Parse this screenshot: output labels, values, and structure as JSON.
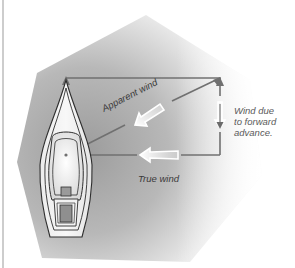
{
  "diagram": {
    "labels": {
      "apparent_wind": "Apparent wind",
      "forward_wind_line1": "Wind due",
      "forward_wind_line2": "to forward",
      "forward_wind_line3": "advance.",
      "true_wind": "True wind"
    },
    "elements": {
      "boat": "sailboat-top-view",
      "vectors": [
        "true-wind-vector",
        "forward-advance-wind-vector",
        "apparent-wind-vector"
      ],
      "arrows": [
        "apparent-wind-arrow",
        "forward-advance-arrow",
        "true-wind-arrow"
      ]
    },
    "colors": {
      "background": "#ffffff",
      "shade_dark": "#a9a9a9",
      "shade_light": "#ffffff",
      "vector_line": "#707070",
      "boat_outline": "#2e2e2e",
      "hatch_fill": "#8f8f8f",
      "border": "#bdbdbd"
    }
  }
}
